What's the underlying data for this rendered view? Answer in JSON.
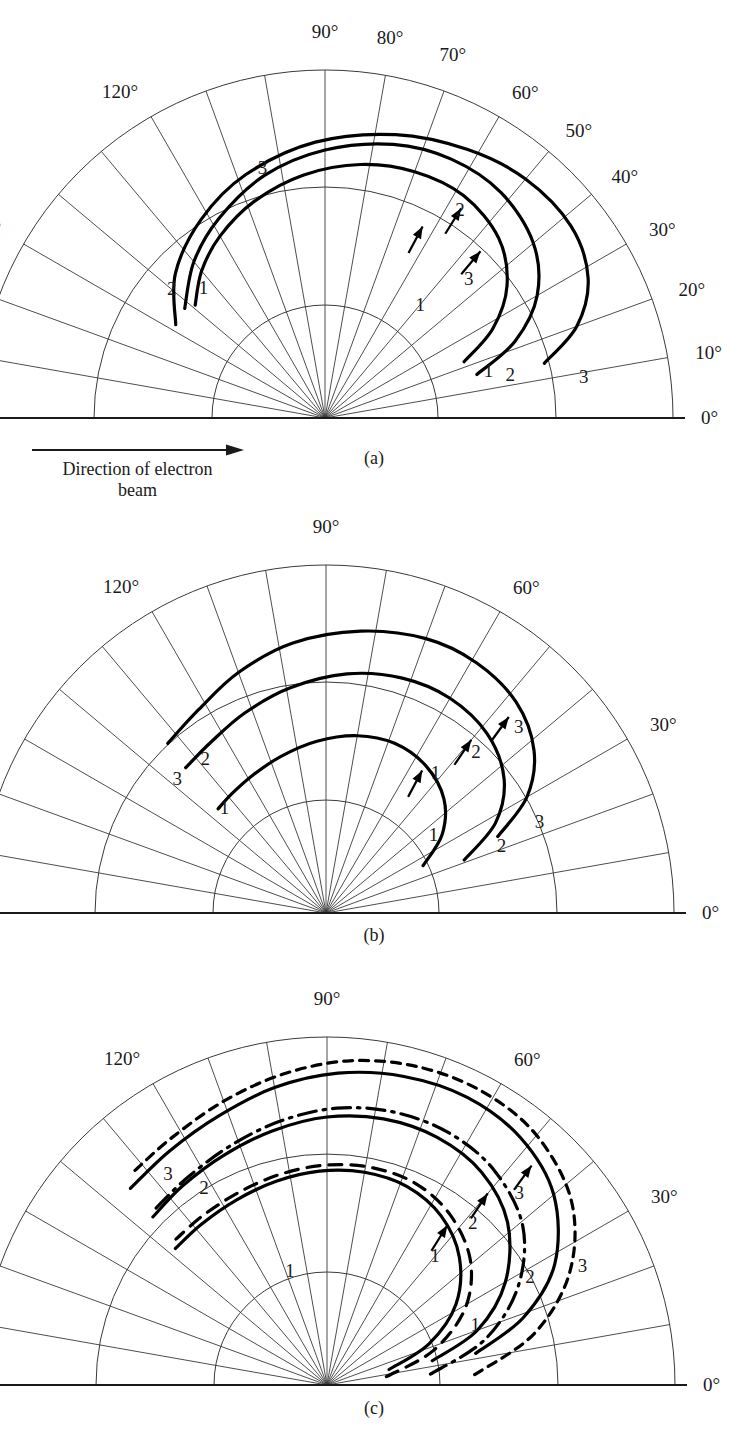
{
  "figure": {
    "type": "polar-scatter-diagram-figure",
    "beam_note": {
      "line1": "Direction of electron",
      "line2": "beam",
      "arrow_icon": "right-arrow-icon"
    },
    "bottom_caption": "",
    "panels": [
      {
        "id": "a",
        "caption": "(a)",
        "cx": 325,
        "cy": 418,
        "r_outer": 348,
        "arcs": [
          113,
          231,
          348
        ],
        "angle_step": 10,
        "tick_labels": [
          {
            "text": "0°",
            "angle": 0
          },
          {
            "text": "10°",
            "angle": 10
          },
          {
            "text": "20°",
            "angle": 20
          },
          {
            "text": "30°",
            "angle": 30
          },
          {
            "text": "40°",
            "angle": 40
          },
          {
            "text": "50°",
            "angle": 50
          },
          {
            "text": "60°",
            "angle": 60
          },
          {
            "text": "70°",
            "angle": 70
          },
          {
            "text": "80°",
            "angle": 80
          },
          {
            "text": "90°",
            "angle": 90
          },
          {
            "text": "120°",
            "angle": 120
          },
          {
            "text": "150°",
            "angle": 150
          }
        ],
        "curves": [
          {
            "name": "1",
            "style": "solid",
            "points": [
              [
                22,
                150
              ],
              [
                28,
                190
              ],
              [
                36,
                225
              ],
              [
                46,
                250
              ],
              [
                58,
                262
              ],
              [
                70,
                262
              ],
              [
                82,
                256
              ],
              [
                95,
                244
              ],
              [
                108,
                228
              ],
              [
                120,
                210
              ],
              [
                130,
                192
              ],
              [
                139,
                172
              ]
            ],
            "labels": [
              {
                "text": "1",
                "angle": 16,
                "r": 170
              },
              {
                "text": "1",
                "angle": 50,
                "r": 148
              },
              {
                "text": "1",
                "angle": 133,
                "r": 178
              }
            ],
            "arrow": {
              "angle": 63,
              "r": 215,
              "dir": 62
            }
          },
          {
            "name": "2",
            "style": "solid",
            "points": [
              [
                16,
                158
              ],
              [
                22,
                205
              ],
              [
                30,
                245
              ],
              [
                40,
                272
              ],
              [
                52,
                286
              ],
              [
                64,
                288
              ],
              [
                76,
                282
              ],
              [
                90,
                268
              ],
              [
                104,
                250
              ],
              [
                118,
                226
              ],
              [
                130,
                204
              ],
              [
                142,
                178
              ]
            ],
            "labels": [
              {
                "text": "2",
                "angle": 13,
                "r": 190
              },
              {
                "text": "2",
                "angle": 57,
                "r": 248
              },
              {
                "text": "2",
                "angle": 140,
                "r": 200
              }
            ],
            "arrow": {
              "angle": 57,
              "r": 250,
              "dir": 58
            }
          },
          {
            "name": "3",
            "style": "solid",
            "points": [
              [
                14,
                226
              ],
              [
                20,
                268
              ],
              [
                28,
                298
              ],
              [
                38,
                312
              ],
              [
                50,
                312
              ],
              [
                62,
                304
              ],
              [
                76,
                292
              ],
              [
                92,
                276
              ],
              [
                108,
                256
              ],
              [
                122,
                234
              ],
              [
                136,
                208
              ],
              [
                148,
                176
              ]
            ],
            "labels": [
              {
                "text": "3",
                "angle": 9,
                "r": 262
              },
              {
                "text": "3",
                "angle": 44,
                "r": 200
              },
              {
                "text": "3",
                "angle": 104,
                "r": 258
              }
            ],
            "arrow": {
              "angle": 47,
              "r": 228,
              "dir": 50
            }
          }
        ]
      },
      {
        "id": "b",
        "caption": "(b)",
        "cx": 326,
        "cy": 913,
        "r_outer": 348,
        "arcs": [
          113,
          231,
          348
        ],
        "angle_step": 10,
        "tick_labels": [
          {
            "text": "0°",
            "angle": 0
          },
          {
            "text": "30°",
            "angle": 30
          },
          {
            "text": "60°",
            "angle": 60
          },
          {
            "text": "90°",
            "angle": 90
          },
          {
            "text": "120°",
            "angle": 120
          }
        ],
        "curves": [
          {
            "name": "1",
            "style": "solid",
            "points": [
              [
                26,
                108
              ],
              [
                34,
                140
              ],
              [
                44,
                164
              ],
              [
                56,
                178
              ],
              [
                68,
                183
              ],
              [
                80,
                180
              ],
              [
                93,
                172
              ],
              [
                106,
                163
              ],
              [
                118,
                156
              ],
              [
                128,
                152
              ],
              [
                136,
                150
              ]
            ],
            "labels": [
              {
                "text": "1",
                "angle": 36,
                "r": 133
              },
              {
                "text": "1",
                "angle": 52,
                "r": 178
              },
              {
                "text": "1",
                "angle": 134,
                "r": 146
              }
            ],
            "arrow": {
              "angle": 56,
              "r": 172,
              "dir": 62
            }
          },
          {
            "name": "2",
            "style": "solid",
            "points": [
              [
                21,
                148
              ],
              [
                28,
                192
              ],
              [
                37,
                223
              ],
              [
                48,
                241
              ],
              [
                60,
                248
              ],
              [
                72,
                247
              ],
              [
                85,
                240
              ],
              [
                99,
                228
              ],
              [
                112,
                216
              ],
              [
                124,
                206
              ],
              [
                134,
                202
              ]
            ],
            "labels": [
              {
                "text": "2",
                "angle": 21,
                "r": 188
              },
              {
                "text": "2",
                "angle": 47,
                "r": 220
              },
              {
                "text": "2",
                "angle": 128,
                "r": 196
              }
            ],
            "arrow": {
              "angle": 50,
              "r": 226,
              "dir": 56
            }
          },
          {
            "name": "3",
            "style": "solid",
            "points": [
              [
                24,
                188
              ],
              [
                30,
                232
              ],
              [
                38,
                264
              ],
              [
                48,
                284
              ],
              [
                59,
                292
              ],
              [
                70,
                292
              ],
              [
                83,
                284
              ],
              [
                97,
                272
              ],
              [
                110,
                256
              ],
              [
                122,
                240
              ],
              [
                133,
                232
              ]
            ],
            "labels": [
              {
                "text": "3",
                "angle": 23,
                "r": 232
              },
              {
                "text": "3",
                "angle": 44,
                "r": 268
              },
              {
                "text": "3",
                "angle": 138,
                "r": 200
              }
            ],
            "arrow": {
              "angle": 47,
              "r": 268,
              "dir": 54
            }
          }
        ]
      },
      {
        "id": "c",
        "caption": "(c)",
        "cx": 327,
        "cy": 1385,
        "r_outer": 348,
        "arcs": [
          113,
          231,
          348
        ],
        "angle_step": 10,
        "tick_labels": [
          {
            "text": "0°",
            "angle": 0
          },
          {
            "text": "30°",
            "angle": 30
          },
          {
            "text": "60°",
            "angle": 60
          },
          {
            "text": "90°",
            "angle": 90
          },
          {
            "text": "120°",
            "angle": 120
          }
        ],
        "curves": [
          {
            "name": "1",
            "style": "solid",
            "points": [
              [
                14,
                64
              ],
              [
                22,
                110
              ],
              [
                32,
                152
              ],
              [
                44,
                184
              ],
              [
                56,
                204
              ],
              [
                68,
                214
              ],
              [
                80,
                216
              ],
              [
                92,
                214
              ],
              [
                104,
                210
              ],
              [
                116,
                206
              ],
              [
                128,
                204
              ],
              [
                138,
                204
              ]
            ],
            "labels": [
              {
                "text": "1",
                "angle": 22,
                "r": 160
              },
              {
                "text": "1",
                "angle": 50,
                "r": 168
              },
              {
                "text": "1",
                "angle": 108,
                "r": 120
              }
            ],
            "arrow": {
              "angle": 53,
              "r": 200,
              "dir": 58
            }
          },
          {
            "name": "1-alt",
            "style": "dashed",
            "points": [
              [
                8,
                60
              ],
              [
                18,
                112
              ],
              [
                29,
                158
              ],
              [
                41,
                190
              ],
              [
                54,
                210
              ],
              [
                66,
                220
              ],
              [
                78,
                222
              ],
              [
                90,
                220
              ],
              [
                102,
                216
              ],
              [
                114,
                212
              ],
              [
                126,
                210
              ],
              [
                136,
                210
              ]
            ],
            "labels": [],
            "arrow": null
          },
          {
            "name": "2",
            "style": "solid",
            "points": [
              [
                13,
                108
              ],
              [
                20,
                160
              ],
              [
                30,
                206
              ],
              [
                42,
                243
              ],
              [
                54,
                263
              ],
              [
                66,
                271
              ],
              [
                78,
                272
              ],
              [
                90,
                268
              ],
              [
                102,
                260
              ],
              [
                114,
                252
              ],
              [
                126,
                246
              ],
              [
                136,
                242
              ]
            ],
            "labels": [
              {
                "text": "2",
                "angle": 28,
                "r": 230
              },
              {
                "text": "2",
                "angle": 48,
                "r": 218
              },
              {
                "text": "2",
                "angle": 122,
                "r": 232
              }
            ],
            "arrow": {
              "angle": 50,
              "r": 250,
              "dir": 56
            }
          },
          {
            "name": "2-alt",
            "style": "dashdot",
            "points": [
              [
                6,
                104
              ],
              [
                16,
                164
              ],
              [
                27,
                214
              ],
              [
                39,
                252
              ],
              [
                52,
                272
              ],
              [
                64,
                280
              ],
              [
                76,
                281
              ],
              [
                88,
                277
              ],
              [
                100,
                268
              ],
              [
                112,
                258
              ],
              [
                124,
                250
              ],
              [
                134,
                246
              ]
            ],
            "labels": [],
            "arrow": null
          },
          {
            "name": "3",
            "style": "solid",
            "points": [
              [
                12,
                152
              ],
              [
                19,
                208
              ],
              [
                28,
                258
              ],
              [
                40,
                296
              ],
              [
                52,
                314
              ],
              [
                64,
                320
              ],
              [
                76,
                318
              ],
              [
                88,
                312
              ],
              [
                100,
                302
              ],
              [
                112,
                290
              ],
              [
                124,
                282
              ],
              [
                135,
                278
              ]
            ],
            "labels": [
              {
                "text": "3",
                "angle": 25,
                "r": 282
              },
              {
                "text": "3",
                "angle": 45,
                "r": 272
              },
              {
                "text": "3",
                "angle": 127,
                "r": 264
              }
            ],
            "arrow": {
              "angle": 47,
              "r": 300,
              "dir": 54
            }
          },
          {
            "name": "3-alt",
            "style": "dotted",
            "points": [
              [
                4,
                148
              ],
              [
                14,
                214
              ],
              [
                25,
                268
              ],
              [
                37,
                306
              ],
              [
                50,
                326
              ],
              [
                62,
                332
              ],
              [
                74,
                331
              ],
              [
                86,
                325
              ],
              [
                98,
                314
              ],
              [
                110,
                302
              ],
              [
                122,
                292
              ],
              [
                132,
                288
              ]
            ],
            "labels": [],
            "arrow": null
          }
        ]
      }
    ]
  }
}
